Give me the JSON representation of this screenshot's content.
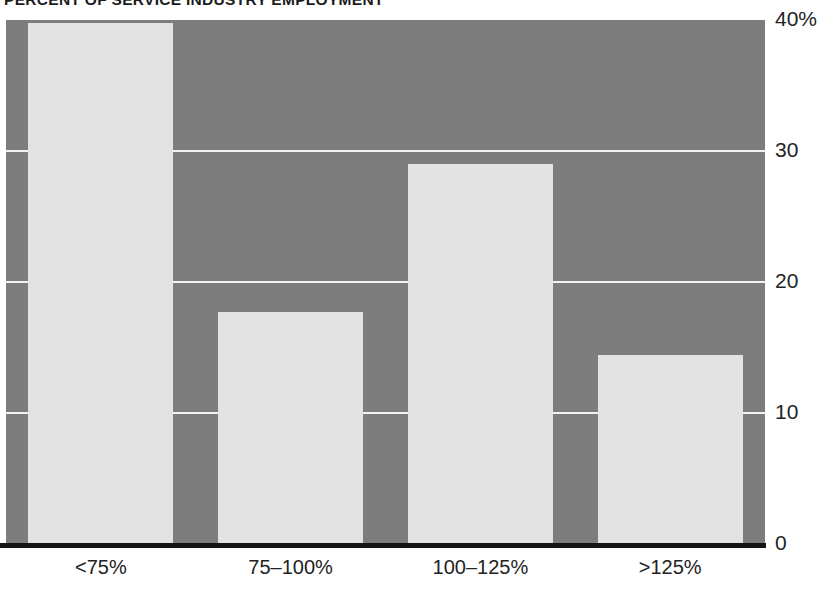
{
  "chart_data": {
    "type": "bar",
    "title": "PERCENT OF SERVICE INDUSTRY EMPLOYMENT",
    "xlabel": "",
    "ylabel": "",
    "categories": [
      "<75%",
      "75–100%",
      "100–125%",
      ">125%"
    ],
    "values": [
      39.8,
      17.7,
      29.0,
      14.4
    ],
    "ylim": [
      0,
      40
    ],
    "yticks": [
      0,
      10,
      20,
      30,
      40
    ],
    "ytick_labels": [
      "0",
      "10",
      "20",
      "30",
      "40%"
    ],
    "grid": true,
    "grid_axis": "y",
    "legend": false,
    "colors": {
      "bar_fill": "#e3e3e3",
      "plot_background": "#7d7d7d",
      "gridline": "#f2f2f2",
      "axis_line": "#141414",
      "text": "#232323",
      "title_text": "#1b1b1b",
      "figure_background": "#ffffff"
    }
  },
  "axes": {
    "y": {
      "ticks": [
        {
          "label": "40%",
          "value": 40
        },
        {
          "label": "30",
          "value": 30
        },
        {
          "label": "20",
          "value": 20
        },
        {
          "label": "10",
          "value": 10
        },
        {
          "label": "0",
          "value": 0
        }
      ]
    },
    "x": {
      "ticks": [
        {
          "label": "<75%"
        },
        {
          "label": "75–100%"
        },
        {
          "label": "100–125%"
        },
        {
          "label": ">125%"
        }
      ]
    }
  }
}
